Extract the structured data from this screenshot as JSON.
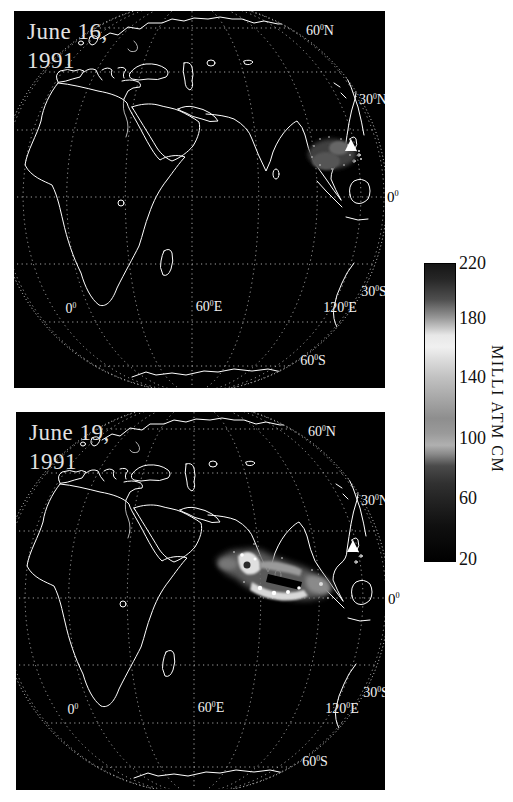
{
  "figure": {
    "background": "#ffffff",
    "panel_background": "#000000",
    "coastline_color": "#ffffff",
    "graticule_color": "#c8c8c8"
  },
  "panels": [
    {
      "id": "june16",
      "date_line1": "June 16,",
      "date_line2": "1991",
      "labels": {
        "lat_60n": "60°N",
        "lat_30n": "30°N",
        "lat_30s": "30°S",
        "lat_60s": "60°S",
        "lon_0": "0°",
        "lon_60e": "60°E",
        "lon_120e": "120°E"
      },
      "equator_outside": "0°",
      "marker": "volcano-triangle"
    },
    {
      "id": "june19",
      "date_line1": "June 19,",
      "date_line2": "1991",
      "labels": {
        "lat_60n": "60°N",
        "lat_30n": "30°N",
        "lat_30s": "30°S",
        "lat_60s": "60°S",
        "lon_0": "0°",
        "lon_60e": "60°E",
        "lon_120e": "120°E"
      },
      "equator_outside": "0°",
      "marker": "volcano-triangle"
    }
  ],
  "colorbar": {
    "unit": "MILLI ATM CM",
    "ticks": [
      "220",
      "180",
      "140",
      "100",
      "60",
      "20"
    ],
    "min": 20,
    "max": 220,
    "scale": "grayscale"
  },
  "chart_data": {
    "type": "heatmap",
    "title": "",
    "legend": {
      "unit": "MILLI ATM CM",
      "tick_values": [
        220,
        180,
        140,
        100,
        60,
        20
      ],
      "orientation": "vertical"
    },
    "maps": [
      {
        "date": "June 16, 1991",
        "plume_region": "west of marker near 15N 120E",
        "marker": "volcano-triangle"
      },
      {
        "date": "June 19, 1991",
        "plume_region": "southern India and Bay of Bengal",
        "marker": "volcano-triangle"
      }
    ]
  }
}
